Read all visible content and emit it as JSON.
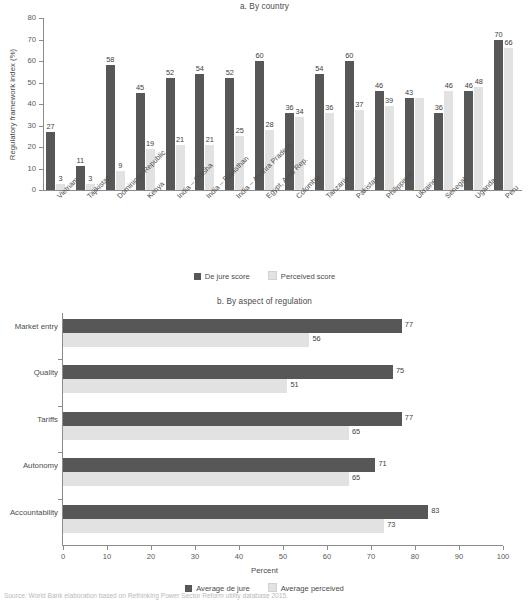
{
  "source_note": "Source: World Bank elaboration based on Rethinking Power Sector Reform utility database 2015.",
  "panel_a": {
    "title": "a. By country",
    "ylabel": "Regulatory framework index (%)",
    "legend": [
      {
        "label": "De jure score",
        "color": "#575757"
      },
      {
        "label": "Perceived score",
        "color": "#e2e2e2"
      }
    ],
    "yticks": [
      "0",
      "10",
      "20",
      "30",
      "40",
      "50",
      "60",
      "70",
      "80"
    ]
  },
  "panel_b": {
    "title": "b. By aspect of regulation",
    "xlabel": "Percent",
    "legend": [
      {
        "label": "Average de jure",
        "color": "#575757"
      },
      {
        "label": "Average perceived",
        "color": "#e2e2e2"
      }
    ],
    "xticks": [
      "0",
      "10",
      "20",
      "30",
      "40",
      "50",
      "60",
      "70",
      "80",
      "90",
      "100"
    ]
  },
  "chart_data": [
    {
      "type": "bar",
      "orientation": "vertical",
      "title": "a. By country",
      "xlabel": "",
      "ylabel": "Regulatory framework index (%)",
      "ylim": [
        0,
        80
      ],
      "ytick_step": 10,
      "grid": false,
      "legend_position": "bottom",
      "categories": [
        "Vietnam",
        "Tajikistan",
        "Dominican Republic",
        "Kenya",
        "India – Odisha",
        "India – Rajasthan",
        "India – Andhra Pradesh",
        "Egypt, Arab Rep.",
        "Colombia",
        "Tanzania",
        "Pakistan",
        "Philippines",
        "Ukraine",
        "Senegal",
        "Uganda",
        "Peru"
      ],
      "series": [
        {
          "name": "De jure score",
          "color": "#575757",
          "values": [
            27,
            11,
            58,
            45,
            52,
            54,
            52,
            60,
            36,
            54,
            60,
            46,
            43,
            36,
            46,
            70
          ]
        },
        {
          "name": "Perceived score",
          "color": "#e2e2e2",
          "values": [
            3,
            3,
            9,
            19,
            21,
            21,
            25,
            28,
            34,
            36,
            37,
            39,
            43,
            46,
            48,
            66
          ]
        }
      ]
    },
    {
      "type": "bar",
      "orientation": "horizontal",
      "title": "b. By aspect of regulation",
      "xlabel": "Percent",
      "ylabel": "",
      "xlim": [
        0,
        100
      ],
      "xtick_step": 10,
      "grid": false,
      "legend_position": "bottom",
      "categories": [
        "Market entry",
        "Quality",
        "Tariffs",
        "Autonomy",
        "Accountability"
      ],
      "series": [
        {
          "name": "Average de jure",
          "color": "#575757",
          "values": [
            77,
            75,
            77,
            71,
            83
          ]
        },
        {
          "name": "Average perceived",
          "color": "#e2e2e2",
          "values": [
            56,
            51,
            65,
            65,
            73
          ]
        }
      ]
    }
  ]
}
